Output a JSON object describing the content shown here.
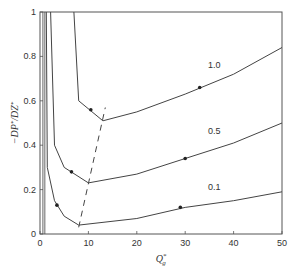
{
  "chart_data": {
    "type": "line",
    "title": "",
    "xlabel": "Q*_g",
    "ylabel": "-DP*/DZ*",
    "xlim": [
      0,
      50
    ],
    "ylim": [
      0,
      1
    ],
    "grid": false,
    "legend": "inline curve labels",
    "x_ticks": [
      0,
      10,
      20,
      30,
      40,
      50
    ],
    "y_ticks": [
      0,
      0.2,
      0.4,
      0.6,
      0.8,
      1
    ],
    "x_tick_labels": [
      "0",
      "10",
      "20",
      "30",
      "40",
      "50"
    ],
    "y_tick_labels": [
      "0",
      "0.2",
      "0.4",
      "0.6",
      "0.8",
      "1"
    ],
    "series": [
      {
        "name": "1.0",
        "style": "solid",
        "x": [
          7,
          8,
          13,
          20,
          30,
          40,
          50
        ],
        "y": [
          1.0,
          0.6,
          0.51,
          0.55,
          0.63,
          0.72,
          0.84
        ],
        "label_pos": [
          36,
          0.75
        ],
        "arrows": [
          [
            10.5,
            0.56
          ],
          [
            33,
            0.66
          ]
        ]
      },
      {
        "name": "0.5",
        "style": "solid",
        "x": [
          2.2,
          3,
          5,
          10,
          20,
          30,
          40,
          50
        ],
        "y": [
          1.0,
          0.4,
          0.3,
          0.23,
          0.27,
          0.34,
          0.41,
          0.5
        ],
        "label_pos": [
          36,
          0.45
        ],
        "arrows": [
          [
            6.5,
            0.28
          ],
          [
            30,
            0.34
          ]
        ]
      },
      {
        "name": "0.1",
        "style": "solid",
        "x": [
          1.3,
          1.5,
          3,
          5,
          8,
          20,
          30,
          40,
          50
        ],
        "y": [
          1.0,
          0.3,
          0.15,
          0.08,
          0.04,
          0.07,
          0.12,
          0.15,
          0.19
        ],
        "label_pos": [
          36,
          0.2
        ],
        "arrows": [
          [
            3.5,
            0.13
          ],
          [
            29,
            0.12
          ]
        ]
      },
      {
        "name": "minimum locus",
        "style": "dashed",
        "x": [
          8,
          13.5
        ],
        "y": [
          0.03,
          0.57
        ]
      }
    ],
    "outer_boundary_lines": {
      "x": [
        0.6,
        1.0
      ],
      "y_range": [
        0,
        1
      ]
    }
  }
}
